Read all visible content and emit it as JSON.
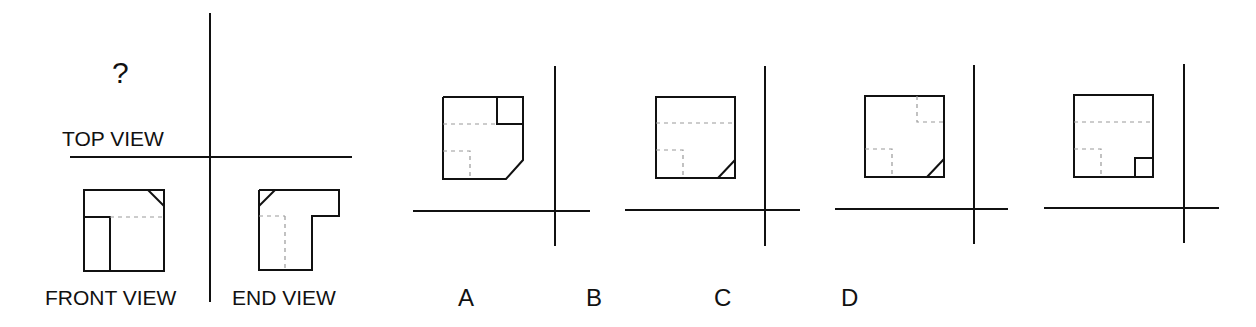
{
  "question": {
    "unknown_marker": "?",
    "labels": {
      "top_view": "TOP VIEW",
      "front_view": "FRONT VIEW",
      "end_view": "END VIEW"
    }
  },
  "options": [
    {
      "label": "A",
      "description": "Square with small solid square at top-right corner, chamfer at bottom-right, dashed hidden line across upper area, dashed small square at bottom-left"
    },
    {
      "label": "B",
      "description": "Square with dashed horizontal hidden line across, dashed small square at bottom-left, chamfer at bottom-right"
    },
    {
      "label": "C",
      "description": "Square with dashed small square at top-right, dashed small square at bottom-left, chamfer at bottom-right"
    },
    {
      "label": "D",
      "description": "Square with dashed horizontal hidden line across, dashed small square at bottom-left, solid small square at bottom-right"
    }
  ],
  "colors": {
    "line": "#111111",
    "hidden_line": "#999999",
    "background": "#ffffff"
  }
}
